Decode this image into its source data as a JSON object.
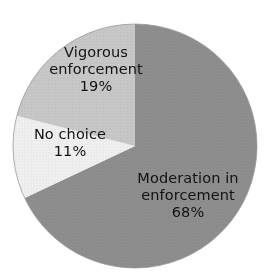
{
  "clipped_caption": "",
  "chart_data": {
    "type": "pie",
    "title": "",
    "xlabel": "",
    "ylabel": "",
    "start_angle_deg": 0,
    "direction": "clockwise",
    "legend": "none",
    "grid": false,
    "categories": [
      "Moderation in enforcement",
      "Vigorous enforcement",
      "No choice"
    ],
    "values": [
      68,
      19,
      11
    ],
    "value_unit": "%",
    "slices": [
      {
        "label": "Moderation in enforcement",
        "label_line1": "Moderation in",
        "label_line2": "enforcement",
        "value": 68,
        "value_text": "68%",
        "color": "#8e8e8e",
        "start_deg": 0,
        "end_deg": 244.8
      },
      {
        "label": "No choice",
        "label_line1": "No choice",
        "label_line2": "",
        "value": 11,
        "value_text": "11%",
        "color": "#f0f0f0",
        "start_deg": 244.8,
        "end_deg": 284.4
      },
      {
        "label": "Vigorous enforcement",
        "label_line1": "Vigorous",
        "label_line2": "enforcement",
        "value": 19,
        "value_text": "19%",
        "color": "#c8c8c8",
        "start_deg": 284.4,
        "end_deg": 360
      }
    ],
    "geometry": {
      "center_x": 135,
      "center_y": 146,
      "radius": 122
    },
    "colors": {
      "moderation": "#8e8e8e",
      "no_choice": "#f0f0f0",
      "vigorous": "#c8c8c8",
      "outline": "#9a9a9a",
      "text": "#121212",
      "background": "#ffffff"
    }
  }
}
